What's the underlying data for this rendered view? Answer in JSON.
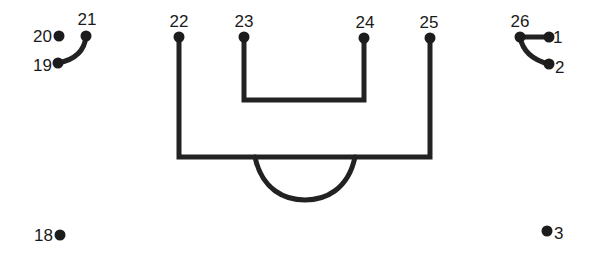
{
  "worksheet": {
    "type": "connect-the-dots",
    "ink_color": "#1c1c1c",
    "background": "#ffffff",
    "dots": [
      {
        "label": "1",
        "x": 549,
        "y": 37,
        "label_x": 553,
        "label_y": 43,
        "anchor": "start"
      },
      {
        "label": "2",
        "x": 549,
        "y": 64,
        "label_x": 555,
        "label_y": 73,
        "anchor": "start"
      },
      {
        "label": "3",
        "x": 547,
        "y": 231,
        "label_x": 554,
        "label_y": 239,
        "anchor": "start"
      },
      {
        "label": "18",
        "x": 60,
        "y": 235,
        "label_x": 53,
        "label_y": 241,
        "anchor": "end"
      },
      {
        "label": "19",
        "x": 58,
        "y": 63,
        "label_x": 52,
        "label_y": 71,
        "anchor": "end"
      },
      {
        "label": "20",
        "x": 59,
        "y": 36,
        "label_x": 52,
        "label_y": 42,
        "anchor": "end"
      },
      {
        "label": "21",
        "x": 86,
        "y": 36,
        "label_x": 87,
        "label_y": 25,
        "anchor": "middle"
      },
      {
        "label": "22",
        "x": 179,
        "y": 37,
        "label_x": 179,
        "label_y": 27,
        "anchor": "middle"
      },
      {
        "label": "23",
        "x": 244,
        "y": 37,
        "label_x": 244,
        "label_y": 27,
        "anchor": "middle"
      },
      {
        "label": "24",
        "x": 364,
        "y": 38,
        "label_x": 365,
        "label_y": 28,
        "anchor": "middle"
      },
      {
        "label": "25",
        "x": 430,
        "y": 38,
        "label_x": 429,
        "label_y": 28,
        "anchor": "middle"
      },
      {
        "label": "26",
        "x": 520,
        "y": 37,
        "label_x": 520,
        "label_y": 27,
        "anchor": "middle"
      }
    ],
    "drawn_paths": [
      {
        "name": "curve-19-21",
        "d": "M58 63 Q84 58 86 36"
      },
      {
        "name": "line-26-1",
        "d": "M520 37 L549 37"
      },
      {
        "name": "curve-26-2",
        "d": "M520 37 Q524 58 549 64"
      },
      {
        "name": "outer-box",
        "d": "M179 37 L179 157 L430 157 L430 38"
      },
      {
        "name": "inner-u",
        "d": "M244 37 L244 100 L364 100 L364 38"
      },
      {
        "name": "bottom-arc",
        "d": "M255 157 C262 190 285 200 305 200 C325 200 348 190 355 157"
      }
    ]
  }
}
